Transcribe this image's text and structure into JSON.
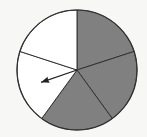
{
  "diagram": {
    "type": "spinner",
    "center": [
      77,
      70
    ],
    "radius": 60,
    "sector_count": 5,
    "sectors": [
      {
        "index": 0,
        "start_deg": 0,
        "end_deg": 72,
        "fill": "#808080",
        "label": "shaded"
      },
      {
        "index": 1,
        "start_deg": 72,
        "end_deg": 144,
        "fill": "#808080",
        "label": "shaded"
      },
      {
        "index": 2,
        "start_deg": 144,
        "end_deg": 216,
        "fill": "#808080",
        "label": "shaded"
      },
      {
        "index": 3,
        "start_deg": 216,
        "end_deg": 288,
        "fill": "#ffffff",
        "label": "unshaded"
      },
      {
        "index": 4,
        "start_deg": 288,
        "end_deg": 360,
        "fill": "#ffffff",
        "label": "unshaded"
      }
    ],
    "arrow": {
      "angle_deg": 251,
      "length": 38,
      "color": "#222222"
    },
    "outline_color": "#333333",
    "background": "#f7f7f5"
  }
}
